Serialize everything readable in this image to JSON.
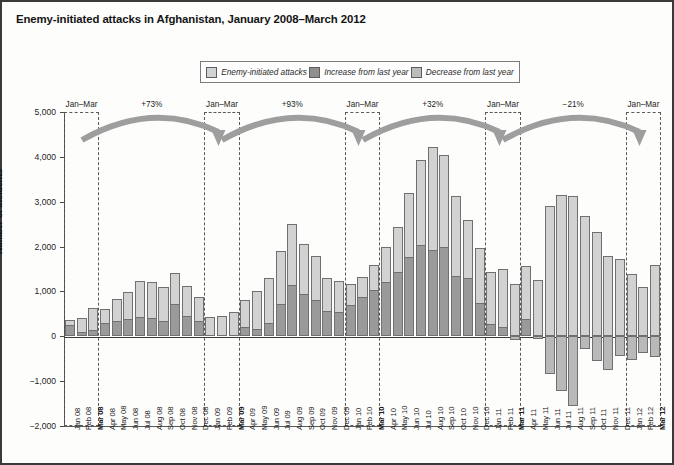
{
  "title": "Enemy-initiated attacks in Afghanistan, January 2008–March 2012",
  "legend": {
    "items": [
      {
        "label": "Enemy-initiated attacks",
        "color": "#d2d2d2",
        "icon": "square-swatch"
      },
      {
        "label": "Increase from last year",
        "color": "#9a9a9a",
        "icon": "square-swatch"
      },
      {
        "label": "Decrease from last year",
        "color": "#b9b9b9",
        "icon": "square-swatch"
      }
    ]
  },
  "annotations": {
    "period_label": "Jan–Mar",
    "period_labels": [
      "Jan–Mar",
      "Jan–Mar",
      "Jan–Mar",
      "Jan–Mar",
      "Jan–Mar"
    ],
    "percent_changes": [
      "+73%",
      "+93%",
      "+32%",
      "−21%"
    ]
  },
  "chart_data": {
    "type": "bar",
    "title": "Enemy-initiated attacks in Afghanistan, January 2008–March 2012",
    "xlabel": "",
    "ylabel": "Number of incidents",
    "ylim": [
      -2000,
      5000
    ],
    "yticks": [
      5000,
      4000,
      3000,
      2000,
      1000,
      0,
      -1000,
      -2000
    ],
    "ytick_labels": [
      "5,000",
      "4,000",
      "3,000",
      "2,000",
      "1,000",
      "0",
      "−1,000",
      "−2,000"
    ],
    "grid": false,
    "legend_position": "top-center",
    "categories": [
      "Jan 08",
      "Feb 08",
      "Mar 08",
      "Apr 08",
      "May 08",
      "Jun 08",
      "Jul 08",
      "Aug 08",
      "Sep 08",
      "Oct 08",
      "Nov 08",
      "Dec 08",
      "Jan 09",
      "Feb 09",
      "Mar 09",
      "Apr 09",
      "May 09",
      "Jun 09",
      "Jul 09",
      "Aug 09",
      "Sep 09",
      "Oct 09",
      "Nov 09",
      "Dec 09",
      "Jan 10",
      "Feb 10",
      "Mar 10",
      "Apr 10",
      "May 10",
      "Jun 10",
      "Jul 10",
      "Aug 10",
      "Sep 10",
      "Oct 10",
      "Nov 10",
      "Dec 10",
      "Jan 11",
      "Feb 11",
      "Mar 11",
      "Apr 11",
      "May 11",
      "Jun 11",
      "Jul 11",
      "Aug 11",
      "Sep 11",
      "Oct 11",
      "Nov 11",
      "Dec 11",
      "Jan 12",
      "Feb 12",
      "Mar 12"
    ],
    "series": [
      {
        "name": "Enemy-initiated attacks",
        "color": "#d2d2d2",
        "values": [
          370,
          400,
          620,
          600,
          830,
          980,
          1230,
          1200,
          1100,
          1420,
          1120,
          870,
          420,
          450,
          540,
          800,
          1000,
          1300,
          1900,
          2500,
          2060,
          1790,
          1300,
          1230,
          1160,
          1320,
          1600,
          2000,
          2430,
          3200,
          3930,
          4230,
          4050,
          3130,
          2600,
          1960,
          1440,
          1500,
          1160,
          1560,
          1250,
          2900,
          3150,
          3130,
          2690,
          2330,
          1780,
          1720,
          1390,
          1100,
          1580
        ]
      },
      {
        "name": "Increase from last year",
        "color": "#9a9a9a",
        "values": [
          260,
          90,
          130,
          300,
          350,
          380,
          420,
          410,
          350,
          730,
          450,
          330,
          0,
          0,
          0,
          200,
          170,
          300,
          720,
          1140,
          950,
          800,
          560,
          540,
          700,
          870,
          1040,
          1220,
          1430,
          1760,
          2030,
          1930,
          1990,
          1340,
          1290,
          750,
          280,
          200,
          0,
          380,
          0,
          0,
          0,
          0,
          0,
          0,
          0,
          0,
          0,
          0,
          0
        ]
      },
      {
        "name": "Decrease from last year",
        "color": "#b9b9b9",
        "values": [
          0,
          0,
          0,
          0,
          0,
          0,
          0,
          0,
          0,
          0,
          0,
          0,
          0,
          0,
          0,
          0,
          0,
          0,
          0,
          0,
          0,
          0,
          0,
          0,
          0,
          0,
          0,
          0,
          0,
          0,
          0,
          0,
          0,
          0,
          0,
          0,
          0,
          0,
          -80,
          0,
          -60,
          -830,
          -1210,
          -1560,
          -290,
          -560,
          -760,
          -430,
          -520,
          -380,
          -460
        ]
      }
    ]
  },
  "axes": {
    "x_tick_labels": [
      "Jan 08",
      "Feb 08",
      "Mar 08",
      "Apr 08",
      "May 08",
      "Jun 08",
      "Jul 08",
      "Aug 08",
      "Sep 08",
      "Oct 08",
      "Nov 08",
      "Dec 08",
      "Jan 09",
      "Feb 09",
      "Mar 09",
      "Apr 09",
      "May 09",
      "Jun 09",
      "Jul 09",
      "Aug 09",
      "Sep 09",
      "Oct 09",
      "Nov 09",
      "Dec 09",
      "Jan 10",
      "Feb 10",
      "Mar 10",
      "Apr 10",
      "May 10",
      "Jun 10",
      "Jul 10",
      "Aug 10",
      "Sep 10",
      "Oct 10",
      "Nov 10",
      "Dec 10",
      "Jan 11",
      "Feb 11",
      "Mar 11",
      "Apr 11",
      "May 11",
      "Jun 11",
      "Jul 11",
      "Aug 11",
      "Sep 11",
      "Oct 11",
      "Nov 11",
      "Dec 11",
      "Jan 12",
      "Feb 12",
      "Mar 12"
    ]
  }
}
